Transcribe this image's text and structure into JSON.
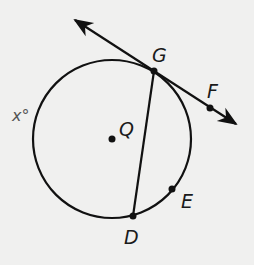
{
  "diagram": {
    "type": "circle-geometry",
    "colors": {
      "stroke": "#111111",
      "background": "#f0f0ef",
      "arc_label": "#555555"
    },
    "circle": {
      "center": "Q",
      "cx": 112,
      "cy": 139,
      "r": 79
    },
    "points": [
      {
        "name": "G",
        "x": 154,
        "y": 71
      },
      {
        "name": "F",
        "x": 210,
        "y": 108
      },
      {
        "name": "Q",
        "x": 112,
        "y": 139
      },
      {
        "name": "E",
        "x": 172,
        "y": 189
      },
      {
        "name": "D",
        "x": 133,
        "y": 216
      }
    ],
    "labels": {
      "G": "G",
      "F": "F",
      "Q": "Q",
      "E": "E",
      "D": "D",
      "arc": "x°"
    },
    "segments": [
      {
        "from": "G",
        "to": "D",
        "kind": "chord"
      }
    ],
    "lines": [
      {
        "through": [
          "G",
          "F"
        ],
        "kind": "tangent",
        "arrows": "both"
      }
    ]
  }
}
